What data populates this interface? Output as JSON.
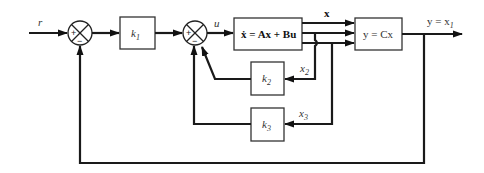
{
  "diagram": {
    "type": "state-feedback block diagram",
    "input_label": "r",
    "control_label": "u",
    "state_vector_label": "x",
    "output_label": "y = x",
    "output_subscript": "1",
    "summing_junctions": [
      {
        "id": "sum1",
        "plus": "+",
        "minus": "−"
      },
      {
        "id": "sum2",
        "plus": "+",
        "minus": "−"
      }
    ],
    "blocks": {
      "k1": {
        "name": "k",
        "sub": "1"
      },
      "plant": {
        "label": "ẋ = Ax + Bu"
      },
      "output": {
        "label": "y = Cx"
      },
      "k2": {
        "name": "k",
        "sub": "2"
      },
      "k3": {
        "name": "k",
        "sub": "3"
      }
    },
    "feedback_labels": {
      "x2": {
        "name": "x",
        "sub": "2"
      },
      "x3": {
        "name": "x",
        "sub": "3"
      }
    }
  }
}
